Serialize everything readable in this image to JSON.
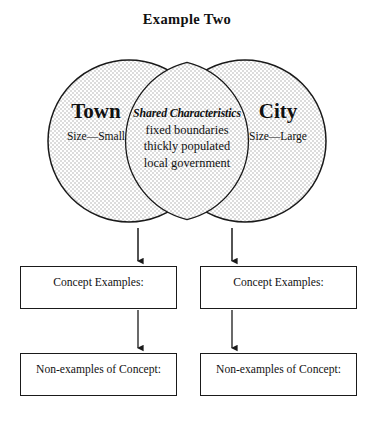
{
  "title": "Example Two",
  "venn": {
    "left": {
      "heading": "Town",
      "detail": "Size—Small"
    },
    "right": {
      "heading": "City",
      "detail": "Size—Large"
    },
    "center": {
      "heading": "Shared Characteristics",
      "lines": [
        "fixed boundaries",
        "thickly populated",
        "local government"
      ]
    },
    "fill_color": "#e9e9e9",
    "stroke_color": "#1a1a1a"
  },
  "boxes": {
    "examples_left": "Concept Examples:",
    "examples_right": "Concept Examples:",
    "nonexamples_left": "Non-examples of Concept:",
    "nonexamples_right": "Non-examples of Concept:"
  },
  "connectors": {
    "arrow_color": "#1a1a1a",
    "count": 4
  }
}
